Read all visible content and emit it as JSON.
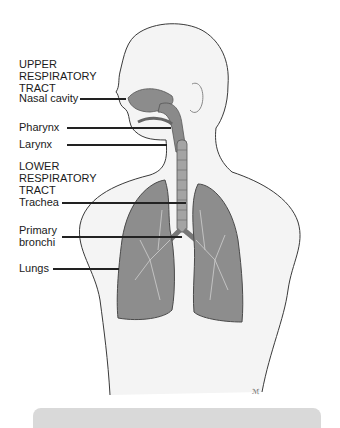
{
  "diagram": {
    "sections": [
      {
        "heading": [
          "UPPER",
          "RESPIRATORY",
          "TRACT"
        ],
        "labels": [
          {
            "text": "Nasal cavity"
          },
          {
            "text": "Pharynx"
          },
          {
            "text": "Larynx"
          }
        ]
      },
      {
        "heading": [
          "LOWER",
          "RESPIRATORY",
          "TRACT"
        ],
        "labels": [
          {
            "text": "Trachea"
          },
          {
            "text": "Primary",
            "text2": "bronchi"
          },
          {
            "text": "Lungs"
          }
        ]
      }
    ],
    "signature": "ℳ",
    "colors": {
      "organ_fill": "#8a8a8a",
      "skin_fill": "#f2f2f2",
      "outline": "#444444",
      "caption_bar": "#d9d9d9"
    }
  }
}
